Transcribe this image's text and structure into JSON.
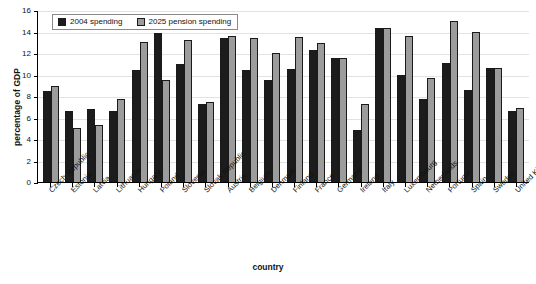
{
  "chart_data": {
    "type": "bar",
    "title": "",
    "xlabel": "country",
    "ylabel": "percentage of GDP",
    "ylim": [
      0,
      16
    ],
    "yticks": [
      0,
      2,
      4,
      6,
      8,
      10,
      12,
      14,
      16
    ],
    "grid": true,
    "legend_position": "top-left",
    "categories": [
      "Czech Republic",
      "Estonia",
      "Latvia",
      "Lithuania",
      "Hungary",
      "Poland",
      "Slovenia",
      "Slovak Republic",
      "Austria",
      "Belgium",
      "Denmark",
      "Finland",
      "France",
      "Germany",
      "Ireland",
      "Italy",
      "Luxembourg",
      "Netherlands",
      "Portugal",
      "Spain",
      "Sweden",
      "United Kingdom"
    ],
    "series": [
      {
        "name": "2004 spending",
        "color": "#1c1c1c",
        "values": [
          8.5,
          6.6,
          6.8,
          6.6,
          10.4,
          13.9,
          11.0,
          7.3,
          13.4,
          10.4,
          9.5,
          10.5,
          12.3,
          11.5,
          4.8,
          14.3,
          10.0,
          7.7,
          11.1,
          8.6,
          10.6,
          6.6
        ]
      },
      {
        "name": "2025 pension spending",
        "color": "#9c9c9c",
        "values": [
          8.9,
          5.0,
          5.3,
          7.7,
          13.0,
          9.5,
          13.25,
          7.4,
          13.55,
          13.4,
          12.0,
          13.5,
          12.9,
          11.5,
          7.3,
          14.35,
          13.6,
          9.7,
          15.0,
          14.0,
          10.6,
          6.9
        ]
      }
    ]
  },
  "axes": {
    "y_title": "percentage of GDP",
    "x_title": "country",
    "y_tick_labels": [
      "16",
      "14",
      "12",
      "10",
      "8",
      "6",
      "4",
      "2",
      "0"
    ]
  },
  "legend": {
    "items": [
      {
        "label": "2004 spending",
        "swatch": "series-1-swatch"
      },
      {
        "label": "2025 pension spending",
        "swatch": "series-2-swatch"
      }
    ]
  }
}
